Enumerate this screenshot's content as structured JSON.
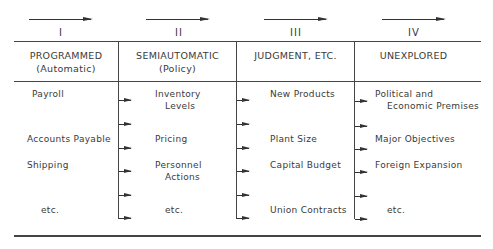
{
  "columns": [
    {
      "numeral": "I",
      "title": "PROGRAMMED",
      "subtitle": "(Automatic)",
      "items": [
        "Payroll",
        "Accounts Payable",
        "Shipping",
        "etc."
      ]
    },
    {
      "numeral": "II",
      "title": "SEMIAUTOMATIC",
      "subtitle": "(Policy)",
      "items": [
        "Inventory",
        "Levels",
        "Pricing",
        "Personnel",
        "Actions",
        "etc."
      ]
    },
    {
      "numeral": "III",
      "title": "JUDGMENT, ETC.",
      "subtitle": "",
      "items": [
        "New Products",
        "Plant Size",
        "Capital Budget",
        "Union Contracts"
      ]
    },
    {
      "numeral": "IV",
      "title": "UNEXPLORED",
      "subtitle": "",
      "items": [
        "Political and",
        "Economic Premises",
        "Major Objectives",
        "Foreign Expansion",
        "etc."
      ]
    }
  ],
  "caption": "FIGURE 3-12  Decision Continuum"
}
